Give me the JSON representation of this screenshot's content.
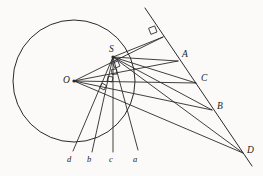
{
  "figure": {
    "background_color": "#fbfaf8",
    "stroke_color": "#2a2a2a",
    "label_color": "#1a1a1a",
    "width": 263,
    "height": 176
  },
  "circle": {
    "name": "main-circle",
    "center_x": 74,
    "center_y": 81,
    "radius": 61
  },
  "points": [
    {
      "id": "O",
      "label": "O",
      "x": 74,
      "y": 81,
      "label_x": 63,
      "label_y": 76,
      "dot": true,
      "size": "upper"
    },
    {
      "id": "S",
      "label": "S",
      "x": 113,
      "y": 57,
      "label_x": 109,
      "label_y": 45,
      "dot": true,
      "size": "upper"
    },
    {
      "id": "A",
      "label": "A",
      "x": 178,
      "y": 61,
      "label_x": 182,
      "label_y": 50,
      "dot": false,
      "size": "upper"
    },
    {
      "id": "C",
      "label": "C",
      "x": 196,
      "y": 83,
      "label_x": 201,
      "label_y": 74,
      "dot": false,
      "size": "upper"
    },
    {
      "id": "B",
      "label": "B",
      "x": 212,
      "y": 110,
      "label_x": 217,
      "label_y": 102,
      "dot": false,
      "size": "upper"
    },
    {
      "id": "D",
      "label": "D",
      "x": 243,
      "y": 153,
      "label_x": 247,
      "label_y": 146,
      "dot": false,
      "size": "upper"
    },
    {
      "id": "d",
      "label": "d",
      "x": 73,
      "y": 151,
      "label_x": 67,
      "label_y": 155,
      "dot": false,
      "size": "lower"
    },
    {
      "id": "b",
      "label": "b",
      "x": 92,
      "y": 152,
      "label_x": 87,
      "label_y": 155,
      "dot": false,
      "size": "lower"
    },
    {
      "id": "c",
      "label": "c",
      "x": 113,
      "y": 152,
      "label_x": 109,
      "label_y": 155,
      "dot": false,
      "size": "lower"
    },
    {
      "id": "a",
      "label": "a",
      "x": 138,
      "y": 150,
      "label_x": 133,
      "label_y": 155,
      "dot": false,
      "size": "lower"
    }
  ],
  "lines": [
    {
      "name": "transversal-AD",
      "x1": 145,
      "y1": 8,
      "x2": 252,
      "y2": 166,
      "width": 1.0
    },
    {
      "name": "perpendicular-S-to-transversal",
      "x1": 113,
      "y1": 57,
      "x2": 163,
      "y2": 37,
      "width": 0.9
    },
    {
      "name": "ray-O-to-S-extended",
      "x1": 74,
      "y1": 81,
      "x2": 163,
      "y2": 37,
      "width": 0.9
    },
    {
      "name": "ray-O-to-A",
      "x1": 74,
      "y1": 81,
      "x2": 178,
      "y2": 61,
      "width": 0.9
    },
    {
      "name": "ray-O-to-C",
      "x1": 74,
      "y1": 81,
      "x2": 196,
      "y2": 83,
      "width": 0.9
    },
    {
      "name": "ray-O-to-B",
      "x1": 74,
      "y1": 81,
      "x2": 212,
      "y2": 110,
      "width": 0.9
    },
    {
      "name": "ray-O-to-D",
      "x1": 74,
      "y1": 81,
      "x2": 243,
      "y2": 153,
      "width": 0.9
    },
    {
      "name": "segment-S-to-A",
      "x1": 113,
      "y1": 57,
      "x2": 178,
      "y2": 61,
      "width": 0.9
    },
    {
      "name": "segment-S-to-C",
      "x1": 113,
      "y1": 57,
      "x2": 196,
      "y2": 83,
      "width": 0.9
    },
    {
      "name": "segment-S-to-B",
      "x1": 113,
      "y1": 57,
      "x2": 212,
      "y2": 110,
      "width": 0.9
    },
    {
      "name": "segment-S-to-D",
      "x1": 113,
      "y1": 57,
      "x2": 243,
      "y2": 153,
      "width": 0.9
    },
    {
      "name": "ray-S-to-a",
      "x1": 113,
      "y1": 57,
      "x2": 138,
      "y2": 150,
      "width": 0.9
    },
    {
      "name": "ray-S-to-c",
      "x1": 113,
      "y1": 57,
      "x2": 113,
      "y2": 152,
      "width": 0.9
    },
    {
      "name": "ray-S-to-b",
      "x1": 113,
      "y1": 57,
      "x2": 92,
      "y2": 152,
      "width": 0.9
    },
    {
      "name": "ray-S-to-d",
      "x1": 113,
      "y1": 57,
      "x2": 73,
      "y2": 151,
      "width": 0.9
    }
  ],
  "right_angle_marks": [
    {
      "name": "right-angle-at-transversal",
      "x": 157,
      "y": 32,
      "size": 6.5,
      "rotation": -21
    },
    {
      "name": "right-angle-at-S-upper",
      "x": 120,
      "y": 66,
      "size": 5.5,
      "rotation": -24
    },
    {
      "name": "right-angle-at-S-middle",
      "x": 117,
      "y": 74,
      "size": 5.0,
      "rotation": -6
    },
    {
      "name": "right-angle-at-S-lower",
      "x": 112,
      "y": 82,
      "size": 5.0,
      "rotation": 12
    },
    {
      "name": "right-angle-at-S-bottom",
      "x": 104,
      "y": 90,
      "size": 5.0,
      "rotation": 30
    }
  ]
}
